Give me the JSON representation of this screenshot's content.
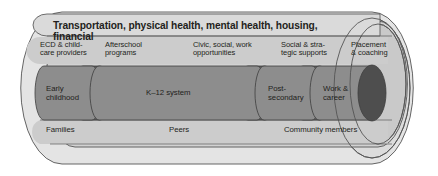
{
  "diagram": {
    "type": "cradle-to-career-pipeline-cylinder",
    "title_band": {
      "text": "Transportation, physical health, mental health, housing, financial"
    },
    "support_labels": [
      {
        "id": "ecd-childcare",
        "text": "ECD & child-\ncare providers"
      },
      {
        "id": "afterschool",
        "text": "Afterschool\nprograms"
      },
      {
        "id": "civic-social-work",
        "text": "Civic, social, work\nopportunities"
      },
      {
        "id": "social-strategic",
        "text": "Social & stra-\ntegic supports"
      },
      {
        "id": "placement-coaching",
        "text": "Placement\n& coaching"
      }
    ],
    "pipeline_segments": [
      {
        "id": "early-childhood",
        "text": "Early\nchildhood"
      },
      {
        "id": "k12-system",
        "text": "K–12 system"
      },
      {
        "id": "post-secondary",
        "text": "Post-\nsecondary"
      },
      {
        "id": "work-career",
        "text": "Work &\ncareer"
      }
    ],
    "base_labels": [
      {
        "id": "families",
        "text": "Families"
      },
      {
        "id": "peers",
        "text": "Peers"
      },
      {
        "id": "community-members",
        "text": "Community members"
      }
    ],
    "colors": {
      "outer_shell": "#e2e2e2",
      "inner_shell": "#cfcfcf",
      "title_band": "#d8d8d8",
      "pipe_body": "#8c8c8c",
      "pipe_joint": "#5e5e5e",
      "end_cap": "#4d4d4d",
      "stroke": "#4a4a4a",
      "text": "#231f20"
    }
  }
}
